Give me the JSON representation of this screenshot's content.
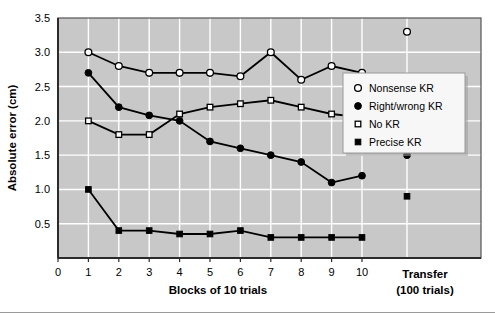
{
  "chart_data": {
    "type": "line",
    "title": "",
    "xlabel": "Blocks of 10 trials",
    "ylabel": "Absolute error (cm)",
    "xlim": [
      0,
      10
    ],
    "ylim": [
      0,
      3.5
    ],
    "ytick_labels": [
      "0.5",
      "1.0",
      "1.5",
      "2.0",
      "2.5",
      "3.0",
      "3.5"
    ],
    "ytick_values": [
      0.5,
      1.0,
      1.5,
      2.0,
      2.5,
      3.0,
      3.5
    ],
    "xtick_labels": [
      "0",
      "1",
      "2",
      "3",
      "4",
      "5",
      "6",
      "7",
      "8",
      "9",
      "10"
    ],
    "xtick_values": [
      0,
      1,
      2,
      3,
      4,
      5,
      6,
      7,
      8,
      9,
      10
    ],
    "categories": [
      1,
      2,
      3,
      4,
      5,
      6,
      7,
      8,
      9,
      10
    ],
    "grid": true,
    "grid_color": "#ffffff",
    "plot_bg": "#c8c8c8",
    "legend_position": "right",
    "transfer_label_line1": "Transfer",
    "transfer_label_line2": "(100 trials)",
    "series": [
      {
        "name": "Nonsense KR",
        "marker": "open-circle",
        "color": "#000000",
        "values": [
          3.0,
          2.8,
          2.7,
          2.7,
          2.7,
          2.65,
          3.0,
          2.6,
          2.8,
          2.7
        ],
        "transfer_value": 3.3
      },
      {
        "name": "Right/wrong KR",
        "marker": "filled-circle",
        "color": "#000000",
        "values": [
          2.7,
          2.2,
          2.08,
          2.0,
          1.7,
          1.6,
          1.5,
          1.4,
          1.1,
          1.2
        ],
        "transfer_value": 1.5
      },
      {
        "name": "No KR",
        "marker": "open-square",
        "color": "#000000",
        "values": [
          2.0,
          1.8,
          1.8,
          2.1,
          2.2,
          2.25,
          2.3,
          2.2,
          2.1,
          2.05
        ],
        "transfer_value": null
      },
      {
        "name": "Precise KR",
        "marker": "filled-square",
        "color": "#000000",
        "values": [
          1.0,
          0.4,
          0.4,
          0.35,
          0.35,
          0.4,
          0.3,
          0.3,
          0.3,
          0.3
        ],
        "transfer_value": 0.9
      }
    ],
    "legend_entries": [
      {
        "label": "Nonsense KR",
        "marker": "open-circle"
      },
      {
        "label": "Right/wrong KR",
        "marker": "filled-circle"
      },
      {
        "label": "No KR",
        "marker": "open-square"
      },
      {
        "label": "Precise KR",
        "marker": "filled-square"
      }
    ]
  }
}
